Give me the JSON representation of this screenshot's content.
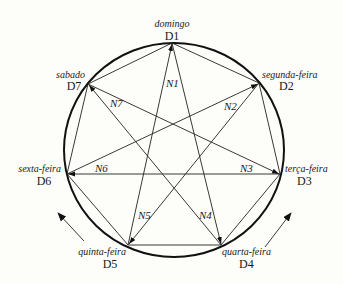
{
  "diagram": {
    "type": "heptagram-weekday-cycle",
    "vertices": [
      {
        "id": "D1",
        "code": "D1",
        "name": "domingo",
        "x": 172,
        "y": 43
      },
      {
        "id": "D2",
        "code": "D2",
        "name": "segunda-feira",
        "x": 259,
        "y": 83
      },
      {
        "id": "D3",
        "code": "D3",
        "name": "terça-feira",
        "x": 280,
        "y": 174
      },
      {
        "id": "D4",
        "code": "D4",
        "name": "quarta-feira",
        "x": 221,
        "y": 245
      },
      {
        "id": "D5",
        "code": "D5",
        "name": "quinta-feira",
        "x": 128,
        "y": 245
      },
      {
        "id": "D6",
        "code": "D6",
        "name": "sexta-feira",
        "x": 67,
        "y": 174
      },
      {
        "id": "D7",
        "code": "D7",
        "name": "sabado",
        "x": 88,
        "y": 84
      }
    ],
    "polygon_edges": [
      [
        "D1",
        "D2"
      ],
      [
        "D2",
        "D3"
      ],
      [
        "D3",
        "D4"
      ],
      [
        "D4",
        "D5"
      ],
      [
        "D5",
        "D6"
      ],
      [
        "D6",
        "D7"
      ],
      [
        "D7",
        "D1"
      ]
    ],
    "arrows": [
      {
        "label": "N1",
        "from": "D5",
        "to": "D1"
      },
      {
        "label": "N2",
        "from": "D6",
        "to": "D2"
      },
      {
        "label": "N3",
        "from": "D7",
        "to": "D3"
      },
      {
        "label": "N4",
        "from": "D1",
        "to": "D4"
      },
      {
        "label": "N5",
        "from": "D2",
        "to": "D5"
      },
      {
        "label": "N6",
        "from": "D3",
        "to": "D6"
      },
      {
        "label": "N7",
        "from": "D4",
        "to": "D7"
      }
    ],
    "labels": {
      "N1": "N1",
      "N2": "N2",
      "N3": "N3",
      "N4": "N4",
      "N5": "N5",
      "N6": "N6",
      "N7": "N7"
    },
    "rotation_arrows": [
      {
        "side": "left",
        "direction": "counter-clockwise"
      },
      {
        "side": "right",
        "direction": "counter-clockwise"
      }
    ]
  }
}
